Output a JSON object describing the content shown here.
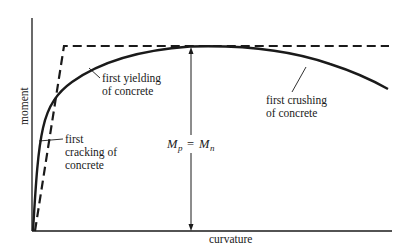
{
  "diagram": {
    "axes": {
      "x_label": "curvature",
      "y_label": "moment"
    },
    "annotations": {
      "yielding_line1": "first yielding",
      "yielding_line2": "of concrete",
      "crushing_line1": "first crushing",
      "crushing_line2": "of concrete",
      "cracking_line1": "first",
      "cracking_line2": "cracking of",
      "cracking_line3": "concrete",
      "moment_eq_M1": "M",
      "moment_eq_sub1": "p",
      "moment_eq_op": "=",
      "moment_eq_M2": "M",
      "moment_eq_sub2": "n"
    },
    "curves": [
      {
        "name": "actual moment-curvature",
        "style": "solid"
      },
      {
        "name": "idealized elastic-plastic",
        "style": "dashed"
      }
    ],
    "colors": {
      "ink": "#1a1a1a",
      "background": "#ffffff"
    }
  }
}
